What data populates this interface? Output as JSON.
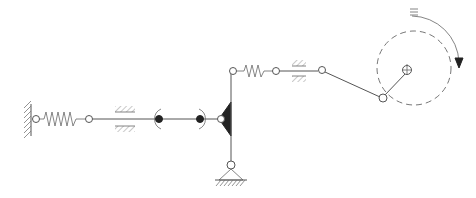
{
  "diagram": {
    "type": "mechanical-kinematic-schematic",
    "background": "#ffffff",
    "line_color": "#555555",
    "fill_color": "#222222",
    "elements": [
      {
        "id": "left-wall-support",
        "kind": "fixed wall (hatched)"
      },
      {
        "id": "left-spring",
        "kind": "spring"
      },
      {
        "id": "left-slider-guide",
        "kind": "prismatic guide"
      },
      {
        "id": "slider-bearing-left",
        "kind": "bearing (arc brackets, filled dot)"
      },
      {
        "id": "slider-bearing-right",
        "kind": "bearing (arc brackets, filled dot)"
      },
      {
        "id": "triangular-rocker",
        "kind": "rigid triangle link (filled)"
      },
      {
        "id": "ground-pivot",
        "kind": "pinned ground support"
      },
      {
        "id": "upper-spring",
        "kind": "spring"
      },
      {
        "id": "upper-slider-guide",
        "kind": "prismatic guide"
      },
      {
        "id": "connecting-rod",
        "kind": "link"
      },
      {
        "id": "crank",
        "kind": "rotating crank with dashed path circle"
      },
      {
        "id": "rotation-arrow",
        "kind": "clockwise rotation indicator"
      }
    ],
    "rotation_direction": "clockwise"
  }
}
